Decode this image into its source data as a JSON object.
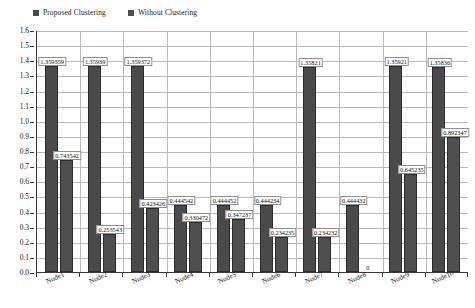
{
  "chart_data": {
    "type": "bar",
    "title": "",
    "xlabel": "",
    "ylabel": "",
    "ylim": [
      0,
      1.6
    ],
    "ytick_step": 0.1,
    "grid": true,
    "legend_position": "top-left",
    "categories": [
      "Node1",
      "Node2",
      "Node3",
      "Node4",
      "Node5",
      "Node6",
      "Node7",
      "Node8",
      "Node9",
      "Node10"
    ],
    "series": [
      {
        "name": "Proposed Clustering",
        "color": "#4a4a4a",
        "values": [
          1.359359,
          1.35939,
          1.359372,
          0.444542,
          0.444452,
          0.444234,
          1.35821,
          0.444432,
          1.35921,
          1.35836
        ],
        "labels": [
          "1.359359",
          "1.35939",
          "1.359372",
          "0.444542",
          "0.444452",
          "0.444234",
          "1.35821",
          "0.444432",
          "1.35921",
          "1.35836"
        ]
      },
      {
        "name": "Without Clustering",
        "color": "#4f4f4f",
        "values": [
          0.743542,
          0.253543,
          0.423426,
          0.330472,
          0.347237,
          0.234235,
          0.234232,
          0,
          0.645235,
          0.892347
        ],
        "labels": [
          "0.743542",
          "0.253543",
          "0.423426",
          "0.330472",
          "0.347237",
          "0.234235",
          "0.234232",
          "0",
          "0.645235",
          "0.892347"
        ]
      }
    ],
    "ytick_labels": [
      "1.6",
      "1.5",
      "1.4",
      "1.3",
      "1.2",
      "1.1",
      "1.0",
      "0.9",
      "0.8",
      "0.7",
      "0.6",
      "0.5",
      "0.4",
      "0.3",
      "0.2",
      "0.1",
      "0.0"
    ]
  },
  "legend": {
    "items": [
      {
        "label": "Proposed Clustering",
        "color": "#4a4a4a"
      },
      {
        "label": "Without Clustering",
        "color": "#4f4f4f"
      }
    ]
  }
}
